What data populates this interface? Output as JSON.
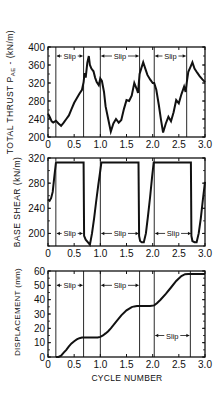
{
  "figure": {
    "xlabel": "CYCLE NUMBER",
    "x_ticks": [
      "0",
      "0.5",
      "1.0",
      "1.5",
      "2.0",
      "2.5",
      "3.0"
    ],
    "slip_label": "Slip",
    "line_color": "#111111"
  },
  "chart_data": [
    {
      "type": "line",
      "title": "",
      "ylabel": "TOTAL THRUST P_AE - (kN/m)",
      "ylabel_main": "TOTAL THRUST P",
      "ylabel_sub": "AE",
      "ylabel_tail": " - (kN/m)",
      "xlabel": "",
      "xlim": [
        0,
        3.0
      ],
      "ylim": [
        200,
        400
      ],
      "y_ticks": [
        200,
        240,
        280,
        320,
        360,
        400
      ],
      "x_ticks": [
        0,
        0.5,
        1.0,
        1.5,
        2.0,
        2.5,
        3.0
      ],
      "vlines": [
        0.15,
        0.68,
        1.0,
        1.75,
        2.03,
        2.65
      ],
      "annotations": [
        {
          "text": "Slip",
          "x_from": 0.15,
          "x_to": 0.68,
          "y": 380
        },
        {
          "text": "Slip",
          "x_from": 1.0,
          "x_to": 1.75,
          "y": 380
        },
        {
          "text": "Slip",
          "x_from": 2.03,
          "x_to": 2.65,
          "y": 380
        }
      ],
      "series": [
        {
          "name": "Total thrust",
          "x": [
            0,
            0.03,
            0.07,
            0.1,
            0.15,
            0.2,
            0.25,
            0.3,
            0.35,
            0.4,
            0.45,
            0.5,
            0.55,
            0.6,
            0.65,
            0.68,
            0.7,
            0.72,
            0.75,
            0.78,
            0.8,
            0.83,
            0.87,
            0.9,
            0.93,
            0.97,
            1.0,
            1.03,
            1.07,
            1.1,
            1.15,
            1.2,
            1.25,
            1.3,
            1.35,
            1.4,
            1.45,
            1.5,
            1.55,
            1.6,
            1.65,
            1.7,
            1.72,
            1.75,
            1.78,
            1.82,
            1.86,
            1.9,
            1.95,
            2.0,
            2.03,
            2.07,
            2.12,
            2.16,
            2.2,
            2.25,
            2.3,
            2.35,
            2.4,
            2.45,
            2.5,
            2.55,
            2.6,
            2.63,
            2.65,
            2.68,
            2.72,
            2.76,
            2.8,
            2.85,
            2.9,
            2.95,
            3.0
          ],
          "y": [
            252,
            245,
            235,
            232,
            236,
            230,
            225,
            232,
            240,
            248,
            262,
            276,
            286,
            296,
            305,
            322,
            342,
            332,
            365,
            380,
            360,
            352,
            346,
            332,
            322,
            315,
            330,
            325,
            300,
            268,
            240,
            212,
            230,
            240,
            232,
            238,
            262,
            282,
            280,
            292,
            320,
            305,
            298,
            340,
            352,
            366,
            352,
            338,
            328,
            320,
            320,
            305,
            270,
            238,
            210,
            230,
            245,
            235,
            255,
            282,
            275,
            295,
            312,
            300,
            320,
            345,
            355,
            366,
            352,
            343,
            335,
            328,
            322
          ]
        }
      ]
    },
    {
      "type": "line",
      "title": "",
      "ylabel": "BASE SHEAR (kN/m)",
      "xlabel": "",
      "xlim": [
        0,
        3.0
      ],
      "ylim": [
        180,
        320
      ],
      "y_ticks": [
        200,
        240,
        280,
        320
      ],
      "x_ticks": [
        0,
        0.5,
        1.0,
        1.5,
        2.0,
        2.5,
        3.0
      ],
      "vlines": [
        0.15,
        1.0,
        2.03
      ],
      "annotations": [
        {
          "text": "Slip",
          "x_from": 0.15,
          "x_to": 0.68,
          "y": 200
        },
        {
          "text": "Slip",
          "x_from": 1.0,
          "x_to": 1.75,
          "y": 200
        },
        {
          "text": "Slip",
          "x_from": 2.03,
          "x_to": 2.75,
          "y": 200
        }
      ],
      "series": [
        {
          "name": "Base shear",
          "x": [
            0,
            0.03,
            0.06,
            0.09,
            0.12,
            0.15,
            0.17,
            0.68,
            0.69,
            0.72,
            0.76,
            0.8,
            0.84,
            0.88,
            0.92,
            0.96,
            1.0,
            1.02,
            1.73,
            1.74,
            1.76,
            1.79,
            1.83,
            1.87,
            1.91,
            1.95,
            1.99,
            2.02,
            2.04,
            2.73,
            2.74,
            2.76,
            2.8,
            2.84,
            2.88,
            2.92,
            2.96,
            3.0
          ],
          "y": [
            254,
            252,
            256,
            266,
            290,
            312,
            313,
            313,
            196,
            190,
            186,
            182,
            200,
            224,
            250,
            276,
            300,
            313,
            313,
            196,
            188,
            186,
            186,
            200,
            228,
            258,
            290,
            313,
            313,
            313,
            196,
            188,
            186,
            186,
            200,
            224,
            254,
            282
          ]
        }
      ]
    },
    {
      "type": "line",
      "title": "",
      "ylabel": "DISPLACEMENT (mm)",
      "xlabel": "CYCLE NUMBER",
      "xlim": [
        0,
        3.0
      ],
      "ylim": [
        0,
        60
      ],
      "y_ticks": [
        0,
        10,
        20,
        30,
        40,
        50,
        60
      ],
      "x_ticks": [
        0,
        0.5,
        1.0,
        1.5,
        2.0,
        2.5,
        3.0
      ],
      "vlines": [
        0.15,
        0.68,
        1.0,
        1.75,
        2.03,
        2.72
      ],
      "annotations": [
        {
          "text": "Slip",
          "x_from": 0.15,
          "x_to": 0.68,
          "y": 50
        },
        {
          "text": "Slip",
          "x_from": 1.0,
          "x_to": 1.75,
          "y": 50
        },
        {
          "text": "Slip",
          "x_from": 2.03,
          "x_to": 2.72,
          "y": 15
        }
      ],
      "series": [
        {
          "name": "Displacement",
          "x": [
            0.15,
            0.2,
            0.25,
            0.3,
            0.35,
            0.4,
            0.45,
            0.5,
            0.55,
            0.6,
            0.65,
            0.68,
            0.75,
            0.85,
            0.95,
            1.0,
            1.05,
            1.1,
            1.15,
            1.2,
            1.3,
            1.4,
            1.5,
            1.6,
            1.65,
            1.7,
            1.75,
            1.85,
            1.95,
            2.03,
            2.08,
            2.15,
            2.25,
            2.35,
            2.45,
            2.55,
            2.62,
            2.68,
            2.72,
            2.8,
            2.9,
            3.0
          ],
          "y": [
            0,
            0,
            1,
            3,
            5,
            7.5,
            9.5,
            11,
            12.3,
            13.1,
            13.5,
            13.5,
            13.5,
            13.5,
            13.6,
            14,
            15,
            16.5,
            18,
            20,
            24.5,
            29,
            32.5,
            34.8,
            35.3,
            35.5,
            35.5,
            35.5,
            35.6,
            36,
            37.5,
            40,
            44,
            48.5,
            53,
            56.5,
            57.8,
            58,
            58,
            58,
            58,
            58
          ]
        }
      ]
    }
  ]
}
